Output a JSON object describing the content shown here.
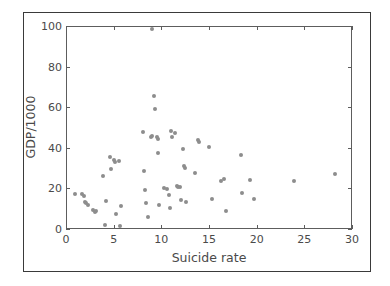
{
  "chart_data": {
    "type": "scatter",
    "title": "",
    "xlabel": "Suicide rate",
    "ylabel": "GDP/1000",
    "xlim": [
      0,
      30
    ],
    "ylim": [
      0,
      100
    ],
    "xticks": [
      0,
      5,
      10,
      15,
      20,
      25,
      30
    ],
    "yticks": [
      0,
      20,
      40,
      60,
      80,
      100
    ],
    "xtick_labels": [
      "0",
      "5",
      "10",
      "15",
      "20",
      "25",
      "30"
    ],
    "ytick_labels": [
      "0",
      "20",
      "40",
      "60",
      "80",
      "100"
    ],
    "grid": false,
    "legend": null,
    "marker": {
      "shape": "circle",
      "color": "#8d8d8d",
      "size_px": 4
    },
    "series": [
      {
        "name": "countries",
        "points": [
          [
            0.9,
            17.0
          ],
          [
            1.7,
            17.2
          ],
          [
            1.9,
            16.5
          ],
          [
            2.0,
            13.5
          ],
          [
            2.1,
            12.6
          ],
          [
            2.3,
            12.0
          ],
          [
            2.8,
            9.2
          ],
          [
            3.0,
            8.2
          ],
          [
            3.1,
            9.1
          ],
          [
            3.9,
            26.3
          ],
          [
            4.1,
            2.2
          ],
          [
            4.2,
            13.6
          ],
          [
            4.6,
            35.6
          ],
          [
            4.7,
            29.5
          ],
          [
            5.0,
            33.8
          ],
          [
            5.1,
            33.0
          ],
          [
            5.2,
            7.3
          ],
          [
            5.6,
            33.4
          ],
          [
            5.7,
            1.5
          ],
          [
            5.8,
            11.1
          ],
          [
            8.1,
            47.8
          ],
          [
            8.2,
            28.5
          ],
          [
            8.3,
            19.4
          ],
          [
            8.4,
            13.0
          ],
          [
            8.6,
            5.8
          ],
          [
            8.9,
            45.3
          ],
          [
            9.0,
            46.0
          ],
          [
            9.0,
            98.5
          ],
          [
            9.2,
            65.3
          ],
          [
            9.3,
            59.0
          ],
          [
            9.5,
            45.1
          ],
          [
            9.6,
            44.3
          ],
          [
            9.7,
            37.6
          ],
          [
            9.8,
            11.8
          ],
          [
            10.3,
            20.2
          ],
          [
            10.6,
            19.5
          ],
          [
            10.8,
            16.7
          ],
          [
            10.9,
            10.2
          ],
          [
            11.0,
            48.5
          ],
          [
            11.1,
            45.3
          ],
          [
            11.4,
            47.2
          ],
          [
            11.6,
            21.3
          ],
          [
            11.8,
            20.8
          ],
          [
            12.0,
            20.5
          ],
          [
            12.1,
            14.2
          ],
          [
            12.3,
            39.4
          ],
          [
            12.4,
            31.0
          ],
          [
            12.5,
            30.2
          ],
          [
            12.6,
            13.5
          ],
          [
            13.5,
            27.6
          ],
          [
            13.8,
            43.6
          ],
          [
            13.9,
            42.7
          ],
          [
            15.0,
            40.6
          ],
          [
            15.3,
            14.7
          ],
          [
            16.3,
            23.8
          ],
          [
            16.6,
            24.5
          ],
          [
            16.8,
            8.7
          ],
          [
            18.4,
            36.5
          ],
          [
            18.5,
            17.8
          ],
          [
            19.3,
            24.3
          ],
          [
            19.7,
            15.0
          ],
          [
            23.9,
            23.7
          ],
          [
            28.2,
            27.0
          ]
        ]
      }
    ]
  }
}
